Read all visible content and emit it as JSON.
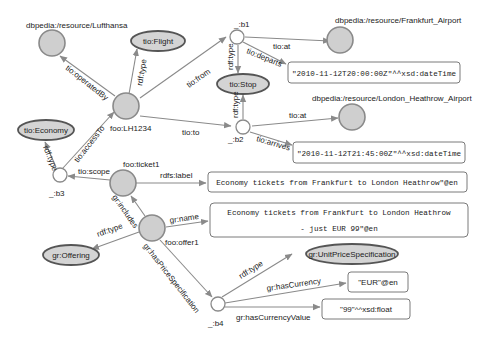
{
  "nodes": {
    "lufthansa": "dbpedia:/resource/Lufthansa",
    "flight_class": "tio:Flight",
    "lh1234": "foo:LH1234",
    "b1": "_:b1",
    "b2": "_:b2",
    "b3": "_:b3",
    "b4": "_:b4",
    "stop_class": "tio:Stop",
    "frankfurt": "dbpedia:/resource/Frankfurt_Airport",
    "heathrow": "dbpedia:/resource/London_Heathrow_Airport",
    "economy_class": "tio:Economy",
    "ticket1": "foo:ticket1",
    "offer1": "foo:offer1",
    "offering_class": "gr:Offering",
    "unitprice_class": "gr:UnitPriceSpecification"
  },
  "literals": {
    "departs": "\"2010-11-12T20:00:00Z\"^^xsd:dateTime",
    "arrives": "\"2010-11-12T21:45:00Z\"^^xsd:dateTime",
    "label": "Economy tickets from Frankfurt to London Heathrow\"@en",
    "name_line1": "Economy tickets from Frankfurt to London Heathrow",
    "name_line2": "- just EUR 99\"@en",
    "currency": "\"EUR\"@en",
    "currency_value": "\"99\"^^xsd:float"
  },
  "edges": {
    "operatedBy": "tio:operatedBy",
    "rdf_type": "rdf:type",
    "from": "tio:from",
    "to": "tio:to",
    "at": "tio:at",
    "departs": "tio:departs",
    "arrives": "tio:arrives",
    "accessTo": "tio:accessTo",
    "scope": "tio:scope",
    "rdfs_label": "rdfs:label",
    "includes": "gr:includes",
    "name": "gr:name",
    "hasPriceSpecification": "gr:hasPriceSpecification",
    "hasCurrency": "gr:hasCurrency",
    "hasCurrencyValue": "gr:hasCurrencyValue"
  }
}
